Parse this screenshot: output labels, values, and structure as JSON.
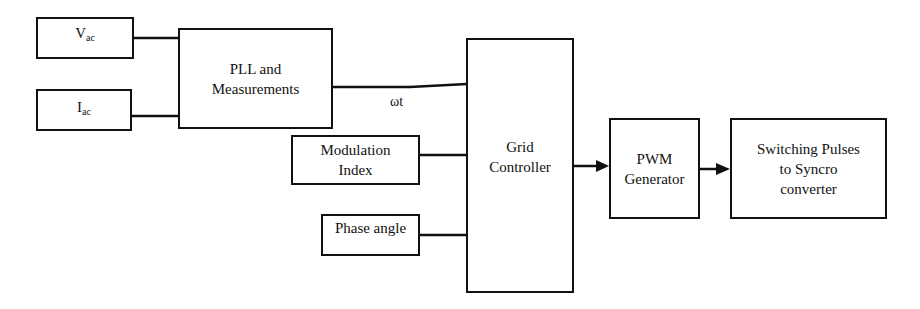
{
  "diagram": {
    "blocks": {
      "vac": {
        "label": "V",
        "sub": "ac"
      },
      "iac": {
        "label": "I",
        "sub": "ac"
      },
      "pll": {
        "line1": "PLL and",
        "line2": "Measurements"
      },
      "modulation": {
        "line1": "Modulation",
        "line2": "Index"
      },
      "phase": {
        "label": "Phase angle"
      },
      "grid": {
        "line1": "Grid",
        "line2": "Controller"
      },
      "pwm": {
        "line1": "PWM",
        "line2": "Generator"
      },
      "switching": {
        "line1": "Switching Pulses",
        "line2": "to Syncro",
        "line3": "converter"
      }
    },
    "signals": {
      "wt": "ωt"
    },
    "connections": [
      {
        "from": "vac",
        "to": "pll"
      },
      {
        "from": "iac",
        "to": "pll"
      },
      {
        "from": "pll",
        "to": "grid",
        "label": "ωt"
      },
      {
        "from": "modulation",
        "to": "grid"
      },
      {
        "from": "phase",
        "to": "grid"
      },
      {
        "from": "grid",
        "to": "pwm",
        "arrow": true
      },
      {
        "from": "pwm",
        "to": "switching",
        "arrow": true
      }
    ]
  }
}
